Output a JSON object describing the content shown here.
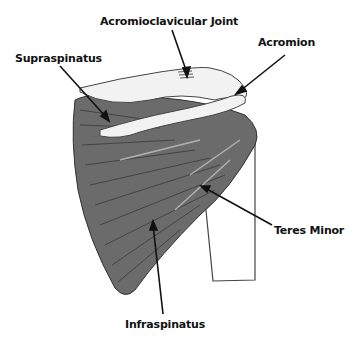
{
  "diagram": {
    "labels": [
      {
        "id": "acromioclavicular-joint",
        "text": "Acromioclavicular Joint",
        "x": 100,
        "y": 15
      },
      {
        "id": "acromion",
        "text": "Acromion",
        "x": 258,
        "y": 36
      },
      {
        "id": "supraspinatus",
        "text": "Supraspinatus",
        "x": 15,
        "y": 52
      },
      {
        "id": "teres-minor",
        "text": "Teres Minor",
        "x": 274,
        "y": 224
      },
      {
        "id": "infraspinatus",
        "text": "Infraspinatus",
        "x": 125,
        "y": 318
      }
    ],
    "colors": {
      "muscle": "#6b6b6b",
      "muscle_dark": "#4a4a4a",
      "bone": "#f2f2f2",
      "outline": "#333333",
      "text": "#111111"
    }
  }
}
